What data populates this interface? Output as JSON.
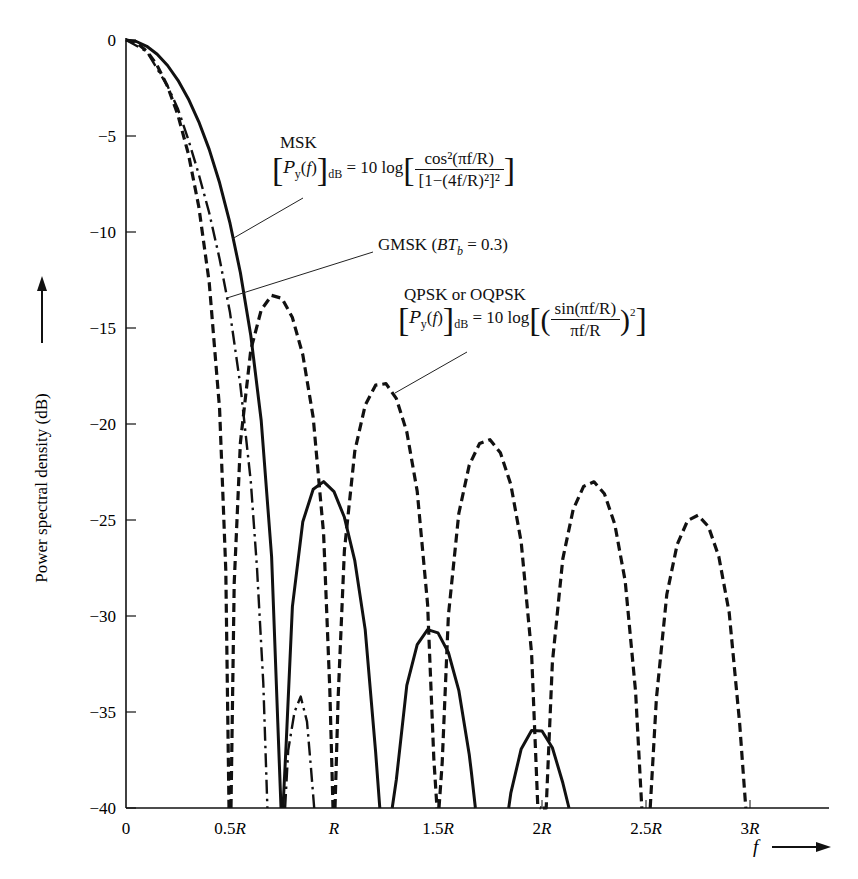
{
  "chart_data": {
    "type": "line",
    "title": "",
    "xlabel": "f",
    "ylabel": "Power spectral density (dB)",
    "xunit": "R",
    "xlim": [
      0,
      3.35
    ],
    "ylim": [
      -40,
      0
    ],
    "grid": false,
    "legend_position": "inline annotations",
    "x_ticks": [
      {
        "value": 0,
        "label": "0"
      },
      {
        "value": 0.5,
        "label": "0.5R"
      },
      {
        "value": 1.0,
        "label": "R"
      },
      {
        "value": 1.5,
        "label": "1.5R"
      },
      {
        "value": 2.0,
        "label": "2R"
      },
      {
        "value": 2.5,
        "label": "2.5R"
      },
      {
        "value": 3.0,
        "label": "3R"
      }
    ],
    "y_ticks": [
      {
        "value": 0,
        "label": "0"
      },
      {
        "value": -5,
        "label": "−5"
      },
      {
        "value": -10,
        "label": "−10"
      },
      {
        "value": -15,
        "label": "−15"
      },
      {
        "value": -20,
        "label": "−20"
      },
      {
        "value": -25,
        "label": "−25"
      },
      {
        "value": -30,
        "label": "−30"
      },
      {
        "value": -35,
        "label": "−35"
      },
      {
        "value": -40,
        "label": "−40"
      }
    ],
    "series": [
      {
        "name": "MSK",
        "style": "solid",
        "formula": "[P_y(f)]_dB = 10 log[cos^2(pi f/R) / [1-(4f/R)^2]^2]",
        "segments": [
          [
            [
              0,
              0
            ],
            [
              0.05,
              -0.08
            ],
            [
              0.1,
              -0.33
            ],
            [
              0.15,
              -0.74
            ],
            [
              0.2,
              -1.33
            ],
            [
              0.25,
              -2.1
            ],
            [
              0.3,
              -3.07
            ],
            [
              0.35,
              -4.26
            ],
            [
              0.4,
              -5.7
            ],
            [
              0.45,
              -7.44
            ],
            [
              0.5,
              -9.54
            ],
            [
              0.55,
              -12.12
            ],
            [
              0.6,
              -15.39
            ],
            [
              0.65,
              -19.82
            ],
            [
              0.7,
              -26.9
            ],
            [
              0.73,
              -35.57
            ],
            [
              0.745,
              -40
            ]
          ],
          [
            [
              0.755,
              -40
            ],
            [
              0.77,
              -36.62
            ],
            [
              0.8,
              -29.51
            ],
            [
              0.85,
              -25.09
            ],
            [
              0.9,
              -23.4
            ],
            [
              0.95,
              -23.0
            ],
            [
              1.0,
              -23.52
            ],
            [
              1.05,
              -24.86
            ],
            [
              1.1,
              -27.12
            ],
            [
              1.15,
              -30.71
            ],
            [
              1.2,
              -37.07
            ],
            [
              1.22,
              -40
            ]
          ],
          [
            [
              1.28,
              -40
            ],
            [
              1.3,
              -38.5
            ],
            [
              1.35,
              -33.61
            ],
            [
              1.4,
              -31.49
            ],
            [
              1.45,
              -30.71
            ],
            [
              1.5,
              -30.88
            ],
            [
              1.55,
              -31.9
            ],
            [
              1.6,
              -33.87
            ],
            [
              1.65,
              -37.2
            ],
            [
              1.66,
              -38.1
            ],
            [
              1.68,
              -40
            ]
          ],
          [
            [
              1.84,
              -40
            ],
            [
              1.85,
              -39.23
            ],
            [
              1.9,
              -36.92
            ],
            [
              1.95,
              -35.97
            ],
            [
              2.0,
              -35.99
            ],
            [
              2.05,
              -36.86
            ],
            [
              2.1,
              -38.69
            ],
            [
              2.13,
              -40
            ]
          ]
        ]
      },
      {
        "name": "GMSK (BT_b = 0.3)",
        "style": "dashdot",
        "segments": [
          [
            [
              0,
              0
            ],
            [
              0.1,
              -0.6
            ],
            [
              0.2,
              -2.4
            ],
            [
              0.25,
              -3.6
            ],
            [
              0.3,
              -5.2
            ],
            [
              0.35,
              -7.0
            ],
            [
              0.4,
              -9.0
            ],
            [
              0.45,
              -11.4
            ],
            [
              0.5,
              -14.2
            ],
            [
              0.55,
              -18.0
            ],
            [
              0.6,
              -23.0
            ],
            [
              0.63,
              -27.5
            ],
            [
              0.66,
              -33.5
            ],
            [
              0.68,
              -40
            ]
          ],
          [
            [
              0.765,
              -40
            ],
            [
              0.78,
              -37.0
            ],
            [
              0.81,
              -35.0
            ],
            [
              0.84,
              -34.2
            ],
            [
              0.87,
              -35.5
            ],
            [
              0.89,
              -38.0
            ],
            [
              0.905,
              -40
            ]
          ]
        ]
      },
      {
        "name": "QPSK or OQPSK",
        "style": "dashed",
        "formula": "[P_y(f)]_dB = 10 log[(sin(pi f/R)/(pi f/R))^2]",
        "segments": [
          [
            [
              0,
              0
            ],
            [
              0.05,
              -0.14
            ],
            [
              0.1,
              -0.58
            ],
            [
              0.15,
              -1.33
            ],
            [
              0.2,
              -2.42
            ],
            [
              0.25,
              -3.92
            ],
            [
              0.3,
              -5.94
            ],
            [
              0.35,
              -8.69
            ],
            [
              0.4,
              -12.62
            ],
            [
              0.45,
              -19.23
            ],
            [
              0.48,
              -27.63
            ],
            [
              0.495,
              -40
            ]
          ],
          [
            [
              0.505,
              -40
            ],
            [
              0.52,
              -28.3
            ],
            [
              0.55,
              -20.97
            ],
            [
              0.6,
              -16.14
            ],
            [
              0.65,
              -14.06
            ],
            [
              0.7,
              -13.3
            ],
            [
              0.75,
              -13.46
            ],
            [
              0.8,
              -14.46
            ],
            [
              0.85,
              -16.39
            ],
            [
              0.9,
              -19.66
            ],
            [
              0.95,
              -25.72
            ],
            [
              0.98,
              -33.83
            ],
            [
              0.995,
              -40
            ]
          ],
          [
            [
              1.005,
              -40
            ],
            [
              1.02,
              -34.18
            ],
            [
              1.05,
              -26.59
            ],
            [
              1.1,
              -21.41
            ],
            [
              1.15,
              -19.02
            ],
            [
              1.2,
              -17.98
            ],
            [
              1.25,
              -17.9
            ],
            [
              1.3,
              -18.68
            ],
            [
              1.35,
              -20.41
            ],
            [
              1.4,
              -23.5
            ],
            [
              1.45,
              -29.39
            ],
            [
              1.48,
              -37.41
            ],
            [
              1.495,
              -40
            ]
          ],
          [
            [
              1.505,
              -40
            ],
            [
              1.52,
              -37.64
            ],
            [
              1.55,
              -29.97
            ],
            [
              1.6,
              -24.66
            ],
            [
              1.65,
              -22.15
            ],
            [
              1.7,
              -21.01
            ],
            [
              1.75,
              -20.82
            ],
            [
              1.8,
              -21.5
            ],
            [
              1.85,
              -23.15
            ],
            [
              1.9,
              -26.15
            ],
            [
              1.95,
              -31.96
            ],
            [
              1.98,
              -39.94
            ],
            [
              1.995,
              -40
            ]
          ],
          [
            [
              2.005,
              -40
            ],
            [
              2.02,
              -40
            ],
            [
              2.05,
              -32.4
            ],
            [
              2.1,
              -27.02
            ],
            [
              2.15,
              -24.45
            ],
            [
              2.2,
              -23.25
            ],
            [
              2.25,
              -23.01
            ],
            [
              2.3,
              -23.63
            ],
            [
              2.35,
              -25.23
            ],
            [
              2.4,
              -28.18
            ],
            [
              2.45,
              -33.95
            ],
            [
              2.48,
              -40
            ]
          ],
          [
            [
              2.52,
              -40
            ],
            [
              2.55,
              -34.3
            ],
            [
              2.6,
              -28.88
            ],
            [
              2.65,
              -26.27
            ],
            [
              2.7,
              -25.03
            ],
            [
              2.75,
              -24.75
            ],
            [
              2.8,
              -25.34
            ],
            [
              2.85,
              -26.9
            ],
            [
              2.9,
              -29.83
            ],
            [
              2.95,
              -35.56
            ],
            [
              2.98,
              -40
            ]
          ]
        ]
      }
    ],
    "annotations": [
      {
        "series": "MSK",
        "peak_sidelobes_dB": [
          -23.3,
          -30.4,
          -35.5
        ]
      },
      {
        "series": "GMSK (BT_b = 0.3)",
        "peak_sidelobes_dB": [
          -34.2
        ]
      },
      {
        "series": "QPSK or OQPSK",
        "peak_sidelobes_dB": [
          -13.3,
          -17.8,
          -20.6,
          -22.8,
          -24.5
        ]
      }
    ]
  },
  "labels": {
    "msk_name": "MSK",
    "gmsk_name": "GMSK",
    "gmsk_param": "BT",
    "gmsk_sub": "b",
    "gmsk_value": "= 0.3)",
    "qpsk_name": "QPSK or OQPSK",
    "psd_symbol": "ℬ",
    "ten_log": "= 10 log",
    "db_sub": "dB",
    "msk_num": "cos²(πf/R)",
    "msk_den": "[1−(4f/R)²]²",
    "qpsk_num": "sin(πf/R)",
    "qpsk_den": "πf/R",
    "x_axis_symbol": "f",
    "y_axis_label": "Power spectral density (dB)"
  }
}
